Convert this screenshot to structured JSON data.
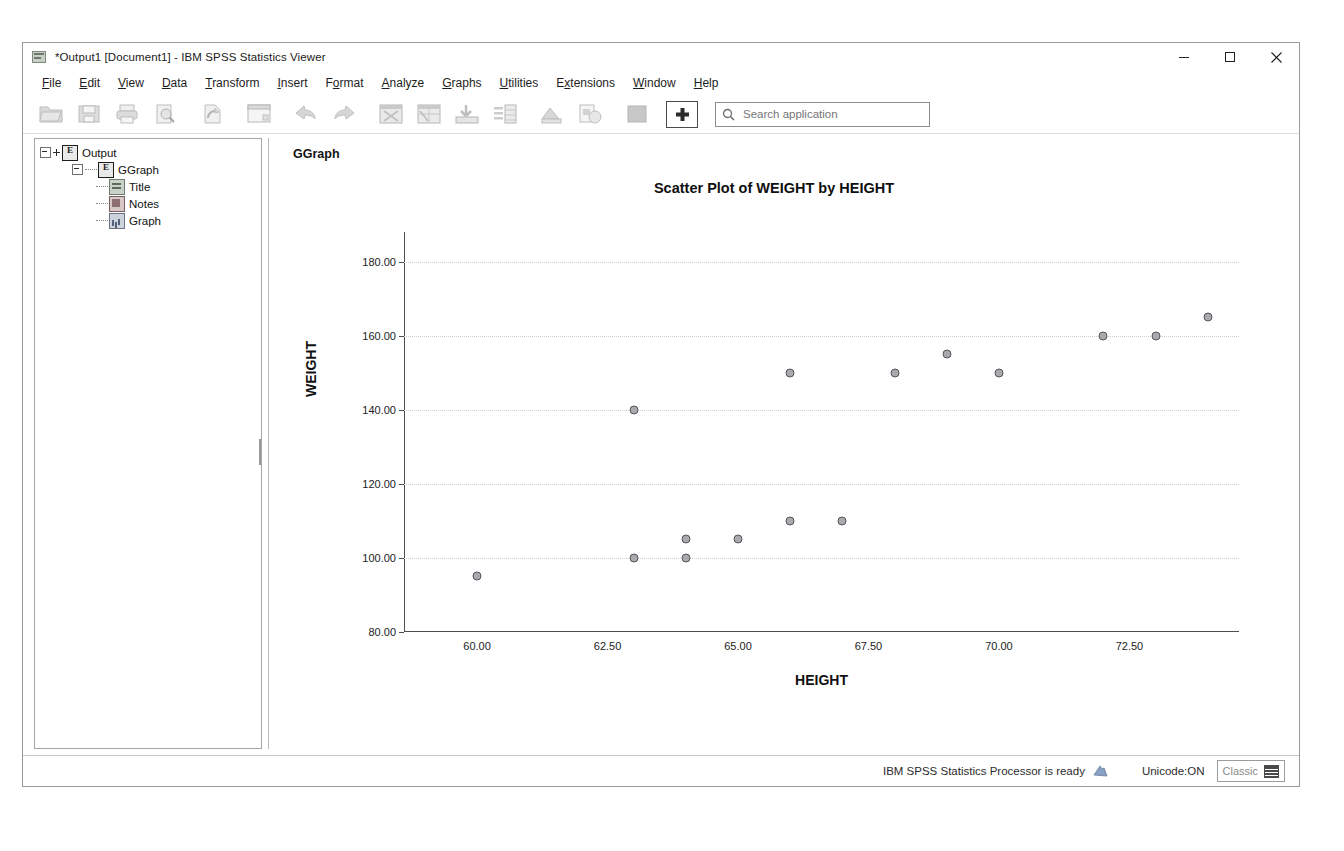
{
  "window": {
    "title": "*Output1 [Document1] - IBM SPSS Statistics Viewer",
    "app_icon": "spss-viewer-icon",
    "controls": {
      "minimize": "minimize-icon",
      "maximize": "maximize-icon",
      "close": "close-icon"
    }
  },
  "menubar": {
    "items": [
      {
        "label": "File",
        "mnemonic": "F"
      },
      {
        "label": "Edit",
        "mnemonic": "E"
      },
      {
        "label": "View",
        "mnemonic": "V"
      },
      {
        "label": "Data",
        "mnemonic": "D"
      },
      {
        "label": "Transform",
        "mnemonic": "T"
      },
      {
        "label": "Insert",
        "mnemonic": "I"
      },
      {
        "label": "Format",
        "mnemonic": "o"
      },
      {
        "label": "Analyze",
        "mnemonic": "A"
      },
      {
        "label": "Graphs",
        "mnemonic": "G"
      },
      {
        "label": "Utilities",
        "mnemonic": "U"
      },
      {
        "label": "Extensions",
        "mnemonic": "x"
      },
      {
        "label": "Window",
        "mnemonic": "W"
      },
      {
        "label": "Help",
        "mnemonic": "H"
      }
    ]
  },
  "toolbar": {
    "buttons": [
      {
        "name": "open-file-icon"
      },
      {
        "name": "save-icon"
      },
      {
        "name": "print-icon"
      },
      {
        "name": "print-preview-icon"
      },
      {
        "name": "recall-dialog-icon"
      },
      {
        "name": "new-window-icon"
      },
      {
        "name": "undo-icon"
      },
      {
        "name": "redo-icon"
      },
      {
        "name": "go-to-data-icon"
      },
      {
        "name": "go-to-case-icon"
      },
      {
        "name": "export-icon"
      },
      {
        "name": "insert-table-icon"
      },
      {
        "name": "show-hide-icon"
      },
      {
        "name": "promote-icon"
      },
      {
        "name": "demote-icon"
      },
      {
        "name": "insert-new-heading-icon"
      }
    ],
    "search": {
      "placeholder": "Search application",
      "value": "",
      "icon": "search-icon"
    }
  },
  "outline": {
    "nodes": [
      {
        "label": "Output",
        "icon": "output-node-icon",
        "level": 0
      },
      {
        "label": "GGraph",
        "icon": "ggraph-node-icon",
        "level": 1
      },
      {
        "label": "Title",
        "icon": "title-node-icon",
        "level": 2
      },
      {
        "label": "Notes",
        "icon": "notes-node-icon",
        "level": 2
      },
      {
        "label": "Graph",
        "icon": "graph-node-icon",
        "level": 2
      }
    ]
  },
  "content": {
    "ggraph_heading": "GGraph"
  },
  "chart_data": {
    "type": "scatter",
    "title": "Scatter Plot of WEIGHT by HEIGHT",
    "xlabel": "HEIGHT",
    "ylabel": "WEIGHT",
    "xlim": [
      58.6,
      74.6
    ],
    "ylim": [
      80,
      188
    ],
    "xticks": [
      "60.00",
      "62.50",
      "65.00",
      "67.50",
      "70.00",
      "72.50"
    ],
    "xtick_values": [
      60.0,
      62.5,
      65.0,
      67.5,
      70.0,
      72.5
    ],
    "yticks": [
      "80.00",
      "100.00",
      "120.00",
      "140.00",
      "160.00",
      "180.00"
    ],
    "ytick_values": [
      80,
      100,
      120,
      140,
      160,
      180
    ],
    "grid": "horizontal-dotted",
    "legend": "none",
    "marker": {
      "shape": "circle",
      "fill": "#a9a9ae",
      "edge": "#55555a"
    },
    "points": [
      {
        "x": 60.0,
        "y": 95
      },
      {
        "x": 63.0,
        "y": 100
      },
      {
        "x": 63.0,
        "y": 140
      },
      {
        "x": 64.0,
        "y": 100
      },
      {
        "x": 64.0,
        "y": 105
      },
      {
        "x": 65.0,
        "y": 105
      },
      {
        "x": 66.0,
        "y": 110
      },
      {
        "x": 66.0,
        "y": 150
      },
      {
        "x": 67.0,
        "y": 110
      },
      {
        "x": 68.0,
        "y": 150
      },
      {
        "x": 69.0,
        "y": 155
      },
      {
        "x": 70.0,
        "y": 150
      },
      {
        "x": 72.0,
        "y": 160
      },
      {
        "x": 73.0,
        "y": 160
      },
      {
        "x": 74.0,
        "y": 165
      }
    ]
  },
  "statusbar": {
    "processor_text": "IBM SPSS Statistics Processor is ready",
    "processor_icon": "processor-ready-icon",
    "unicode": "Unicode:ON",
    "mode_label": "Classic",
    "mode_icon": "classic-mode-icon"
  }
}
